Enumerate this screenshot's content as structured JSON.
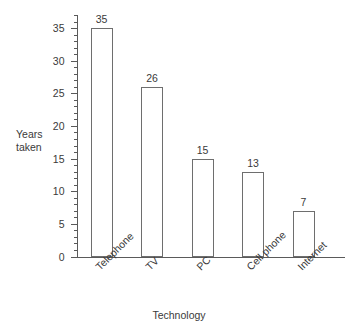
{
  "chart_data": {
    "type": "bar",
    "title": "",
    "subtitle": "",
    "xlabel": "Technology",
    "ylabel": "Years taken",
    "categories": [
      "Telephone",
      "TV",
      "PC",
      "Cell phone",
      "Internet"
    ],
    "values": [
      35,
      26,
      15,
      13,
      7
    ],
    "value_labels": [
      "35",
      "26",
      "15",
      "13",
      "7"
    ],
    "ylim": [
      0,
      37
    ],
    "ytick_labels": [
      "0",
      "5",
      "10",
      "15",
      "20",
      "25",
      "30",
      "35"
    ],
    "ytick_values": [
      0,
      5,
      10,
      15,
      20,
      25,
      30,
      35
    ],
    "minor_tick_interval": 1,
    "grid": false,
    "legend": null,
    "legend_position": "none",
    "bar_fill_color": "#ffffff",
    "bar_edge_color": "#6e6e6e",
    "axis_color": "#5a5a5a",
    "text_color": "#3a3a3a",
    "category_label_rotation_deg": -45
  },
  "axis_titles": {
    "y": "Years\ntaken",
    "x": "Technology"
  }
}
